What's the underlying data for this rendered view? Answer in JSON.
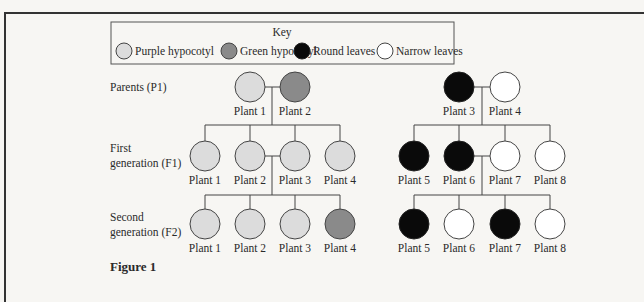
{
  "key": {
    "title": "Key",
    "items": [
      {
        "label": "Purple hypocotyl",
        "fill": "#dcdcdc"
      },
      {
        "label": "Green hypocotyl",
        "fill": "#8a8a8a"
      },
      {
        "label": "Round leaves",
        "fill": "#0a0a0a"
      },
      {
        "label": "Narrow leaves",
        "fill": "#ffffff"
      }
    ]
  },
  "rows": {
    "p1": {
      "line1": "Parents (P1)"
    },
    "f1": {
      "line1": "First",
      "line2": "generation (F1)"
    },
    "f2": {
      "line1": "Second",
      "line2": "generation (F2)"
    }
  },
  "colors": {
    "purple_hypocotyl": "#dcdcdc",
    "green_hypocotyl": "#8a8a8a",
    "round_leaves": "#0a0a0a",
    "narrow_leaves": "#ffffff",
    "stroke": "#444444"
  },
  "crosses": {
    "hypocotyl": {
      "p1": [
        {
          "label": "Plant 1",
          "trait": "Purple hypocotyl"
        },
        {
          "label": "Plant 2",
          "trait": "Green hypocotyl"
        }
      ],
      "f1": [
        {
          "label": "Plant 1",
          "trait": "Purple hypocotyl"
        },
        {
          "label": "Plant 2",
          "trait": "Purple hypocotyl"
        },
        {
          "label": "Plant 3",
          "trait": "Purple hypocotyl"
        },
        {
          "label": "Plant 4",
          "trait": "Purple hypocotyl"
        }
      ],
      "f2": [
        {
          "label": "Plant 1",
          "trait": "Purple hypocotyl"
        },
        {
          "label": "Plant 2",
          "trait": "Purple hypocotyl"
        },
        {
          "label": "Plant 3",
          "trait": "Purple hypocotyl"
        },
        {
          "label": "Plant 4",
          "trait": "Green hypocotyl"
        }
      ]
    },
    "leaves": {
      "p1": [
        {
          "label": "Plant 3",
          "trait": "Round leaves"
        },
        {
          "label": "Plant 4",
          "trait": "Narrow leaves"
        }
      ],
      "f1": [
        {
          "label": "Plant 5",
          "trait": "Round leaves"
        },
        {
          "label": "Plant 6",
          "trait": "Round leaves"
        },
        {
          "label": "Plant 7",
          "trait": "Narrow leaves"
        },
        {
          "label": "Plant 8",
          "trait": "Narrow leaves"
        }
      ],
      "f2": [
        {
          "label": "Plant 5",
          "trait": "Round leaves"
        },
        {
          "label": "Plant 6",
          "trait": "Narrow leaves"
        },
        {
          "label": "Plant 7",
          "trait": "Round leaves"
        },
        {
          "label": "Plant 8",
          "trait": "Narrow leaves"
        }
      ]
    }
  },
  "caption": "Figure 1"
}
